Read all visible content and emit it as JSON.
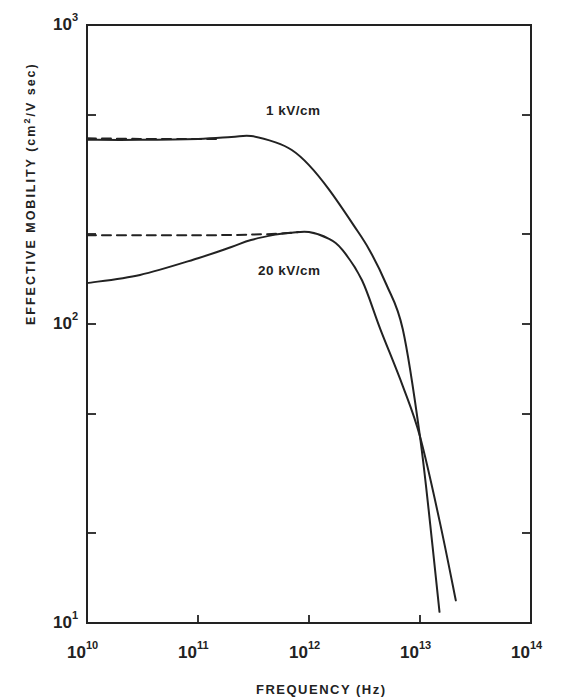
{
  "chart_data": {
    "type": "line",
    "title": "",
    "xlabel": "FREQUENCY (Hz)",
    "ylabel": "EFFECTIVE MOBILITY (cm²/V sec)",
    "xscale": "log",
    "yscale": "log",
    "xlim": [
      10000000000.0,
      100000000000000.0
    ],
    "ylim": [
      10,
      1000
    ],
    "grid": false,
    "legend": "inline labels",
    "x_ticks": [
      {
        "value": 10000000000.0,
        "base": "10",
        "exp": "10"
      },
      {
        "value": 100000000000.0,
        "base": "10",
        "exp": "11"
      },
      {
        "value": 1000000000000.0,
        "base": "10",
        "exp": "12"
      },
      {
        "value": 10000000000000.0,
        "base": "10",
        "exp": "13"
      },
      {
        "value": 100000000000000.0,
        "base": "10",
        "exp": "14"
      }
    ],
    "y_ticks_labeled": [
      {
        "value": 10,
        "base": "10",
        "exp": "1"
      },
      {
        "value": 100,
        "base": "10",
        "exp": "2"
      },
      {
        "value": 1000,
        "base": "10",
        "exp": "3"
      }
    ],
    "y_minor_ticks": [
      20,
      50,
      200,
      500
    ],
    "series": [
      {
        "name": "1 kV/cm",
        "style": "solid",
        "x": [
          10000000000.0,
          30000000000.0,
          100000000000.0,
          200000000000.0,
          300000000000.0,
          500000000000.0,
          700000000000.0,
          1000000000000.0,
          1500000000000.0,
          2500000000000.0,
          3500000000000.0,
          5000000000000.0,
          7000000000000.0,
          10000000000000.0,
          13000000000000.0,
          15000000000000.0
        ],
        "values": [
          413,
          413,
          416,
          422,
          425,
          405,
          382,
          340,
          283,
          215,
          177,
          135,
          96,
          42,
          18,
          10.9
        ]
      },
      {
        "name": "1 kV/cm (dashed)",
        "style": "dashed",
        "x": [
          10000000000.0,
          30000000000.0,
          100000000000.0,
          150000000000.0
        ],
        "values": [
          418,
          416,
          416,
          416
        ]
      },
      {
        "name": "20 kV/cm",
        "style": "solid",
        "x": [
          10000000000.0,
          30000000000.0,
          100000000000.0,
          200000000000.0,
          300000000000.0,
          500000000000.0,
          700000000000.0,
          1000000000000.0,
          1500000000000.0,
          2000000000000.0,
          3000000000000.0,
          4400000000000.0,
          7000000000000.0,
          10000000000000.0,
          15000000000000.0,
          21000000000000.0
        ],
        "values": [
          137,
          146,
          166,
          181,
          191,
          199,
          202,
          203,
          193,
          177,
          140,
          96,
          62,
          42,
          22,
          11.9
        ]
      },
      {
        "name": "20 kV/cm (dashed)",
        "style": "dashed",
        "x": [
          10000000000.0,
          30000000000.0,
          100000000000.0,
          300000000000.0,
          600000000000.0,
          800000000000.0
        ],
        "values": [
          198,
          198,
          198,
          199,
          201,
          203
        ]
      }
    ],
    "annotations": [
      {
        "text": "1 kV/cm",
        "near": {
          "x": 1000000000000.0,
          "y": 520
        }
      },
      {
        "text": "20 kV/cm",
        "near": {
          "x": 1000000000000.0,
          "y": 150
        }
      }
    ]
  },
  "labels": {
    "x_title": "FREQUENCY (Hz)",
    "y_title_main": "EFFECTIVE MOBILITY (cm",
    "y_title_sup": "2",
    "y_title_end": "/V sec)",
    "series_1": "1 kV/cm",
    "series_2": "20 kV/cm",
    "tick_base": "10"
  }
}
